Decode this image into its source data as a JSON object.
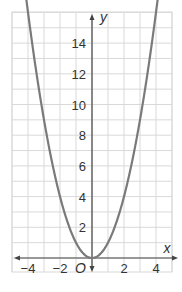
{
  "chart_data": {
    "type": "line",
    "title": "",
    "xlabel": "x",
    "ylabel": "y",
    "origin_label": "O",
    "xlim": [
      -5,
      5
    ],
    "ylim": [
      -1,
      16
    ],
    "grid": true,
    "x_ticks": [
      -4,
      -2,
      2,
      4
    ],
    "x_tick_labels": [
      "−4",
      "−2",
      "2",
      "4"
    ],
    "y_ticks": [
      2,
      4,
      6,
      8,
      10,
      12,
      14
    ],
    "y_tick_labels": [
      "2",
      "4",
      "6",
      "8",
      "10",
      "12",
      "14"
    ],
    "series": [
      {
        "name": "y = x^2",
        "color": "#7a7a7a",
        "x": [
          -4,
          -3,
          -2,
          -1,
          0,
          1,
          2,
          3,
          4
        ],
        "y": [
          16,
          9,
          4,
          1,
          0,
          1,
          4,
          9,
          16
        ],
        "arrows_at_ends": true
      }
    ],
    "colors": {
      "grid": "#d9d9d9",
      "axis": "#444444",
      "curve": "#7a7a7a"
    }
  }
}
